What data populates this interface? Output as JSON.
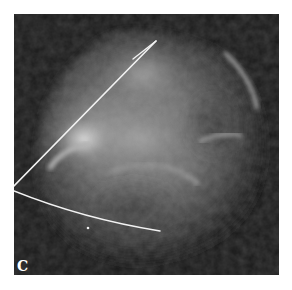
{
  "figure": {
    "panel_label": "C",
    "colors": {
      "background": "#ffffff",
      "panel_background": "#1a1a1a",
      "annotation_line": "#f2f2f2"
    },
    "annotations": {
      "radial_line": {
        "from": [
          0,
          172
        ],
        "to": [
          142,
          27
        ],
        "branch_end": [
          119,
          45
        ]
      },
      "arc_line": {
        "from": [
          0,
          177
        ],
        "to": [
          146,
          217
        ]
      },
      "bright_point": [
        74,
        214
      ]
    }
  }
}
